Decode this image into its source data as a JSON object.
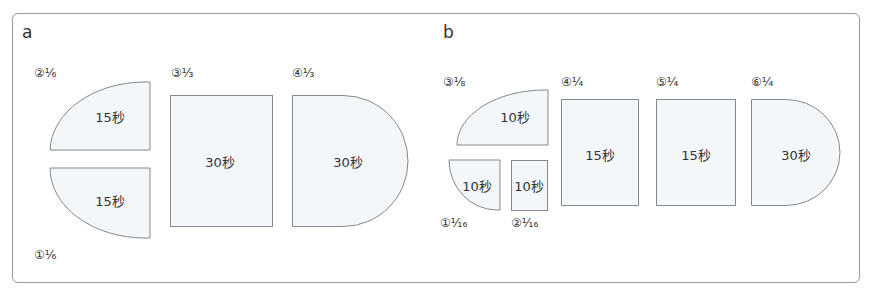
{
  "panels": [
    {
      "letter": "a",
      "pieces": [
        {
          "id": "2",
          "label": "②¹⁄₆",
          "time": "15秒",
          "shape": "quarter-top-left"
        },
        {
          "id": "1",
          "label": "①¹⁄₆",
          "time": "15秒",
          "shape": "quarter-bottom-left"
        },
        {
          "id": "3",
          "label": "③¹⁄₃",
          "time": "30秒",
          "shape": "rectangle"
        },
        {
          "id": "4",
          "label": "④¹⁄₃",
          "time": "30秒",
          "shape": "half-round-right"
        }
      ]
    },
    {
      "letter": "b",
      "pieces": [
        {
          "id": "3",
          "label": "③¹⁄₈",
          "time": "10秒",
          "shape": "quarter-top-left"
        },
        {
          "id": "1",
          "label": "①¹⁄₁₆",
          "time": "10秒",
          "shape": "quarter-bottom-left"
        },
        {
          "id": "2",
          "label": "②¹⁄₁₆",
          "time": "10秒",
          "shape": "rectangle"
        },
        {
          "id": "4",
          "label": "④¹⁄₄",
          "time": "15秒",
          "shape": "rectangle"
        },
        {
          "id": "5",
          "label": "⑤¹⁄₄",
          "time": "15秒",
          "shape": "rectangle"
        },
        {
          "id": "6",
          "label": "⑥¹⁄₄",
          "time": "30秒",
          "shape": "half-round-right"
        }
      ]
    }
  ],
  "colors": {
    "shape_fill": "#f3f7fa",
    "shape_stroke": "#888888",
    "frame": "#9a9a9a"
  }
}
